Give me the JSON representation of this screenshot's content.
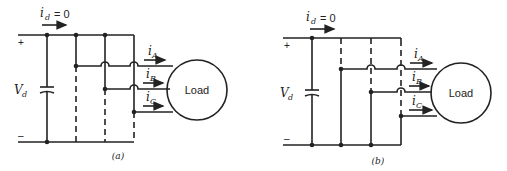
{
  "figure": {
    "panels": [
      {
        "id": "a",
        "caption": "(a)",
        "dc_current_label": "i",
        "dc_current_sub": "d",
        "dc_current_value": "= 0",
        "voltage_label": "V",
        "voltage_sub": "d",
        "plus": "+",
        "minus": "–",
        "load_label": "Load",
        "phase_currents": [
          {
            "label": "i",
            "sub": "A"
          },
          {
            "label": "i",
            "sub": "B"
          },
          {
            "label": "i",
            "sub": "C"
          }
        ],
        "description": "All three phases connected to positive rail (upper switches closed, lower open)"
      },
      {
        "id": "b",
        "caption": "(b)",
        "dc_current_label": "i",
        "dc_current_sub": "d",
        "dc_current_value": "= 0",
        "voltage_label": "V",
        "voltage_sub": "d",
        "plus": "+",
        "minus": "–",
        "load_label": "Load",
        "phase_currents": [
          {
            "label": "i",
            "sub": "A"
          },
          {
            "label": "i",
            "sub": "B"
          },
          {
            "label": "i",
            "sub": "C"
          }
        ],
        "description": "All three phases connected to negative rail (lower switches closed, upper open)"
      }
    ]
  }
}
